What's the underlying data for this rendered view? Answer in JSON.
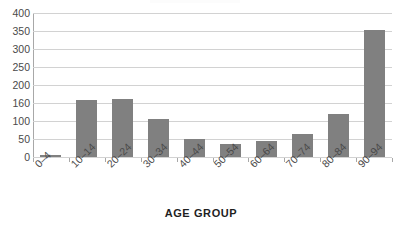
{
  "chart_data": {
    "type": "bar",
    "title": "",
    "xlabel": "AGE GROUP",
    "ylabel": "",
    "categories": [
      "0–4",
      "10–14",
      "20–24",
      "30–34",
      "40–44",
      "50–54",
      "60–64",
      "70–74",
      "80–84",
      "90–94"
    ],
    "values": [
      5,
      158,
      160,
      105,
      50,
      35,
      45,
      65,
      120,
      353
    ],
    "ylim": [
      0,
      400
    ],
    "ytick_labels": [
      "0",
      "50",
      "100",
      "160",
      "200",
      "250",
      "300",
      "350",
      "400"
    ],
    "ytick_values": [
      0,
      50,
      100,
      150,
      200,
      250,
      300,
      350,
      400
    ],
    "grid": true,
    "legend": false,
    "bar_color": "#808080",
    "gridline_color": "#d2d2d2",
    "axis_color": "#a8a8a8",
    "label_color": "#4a4a4a"
  }
}
